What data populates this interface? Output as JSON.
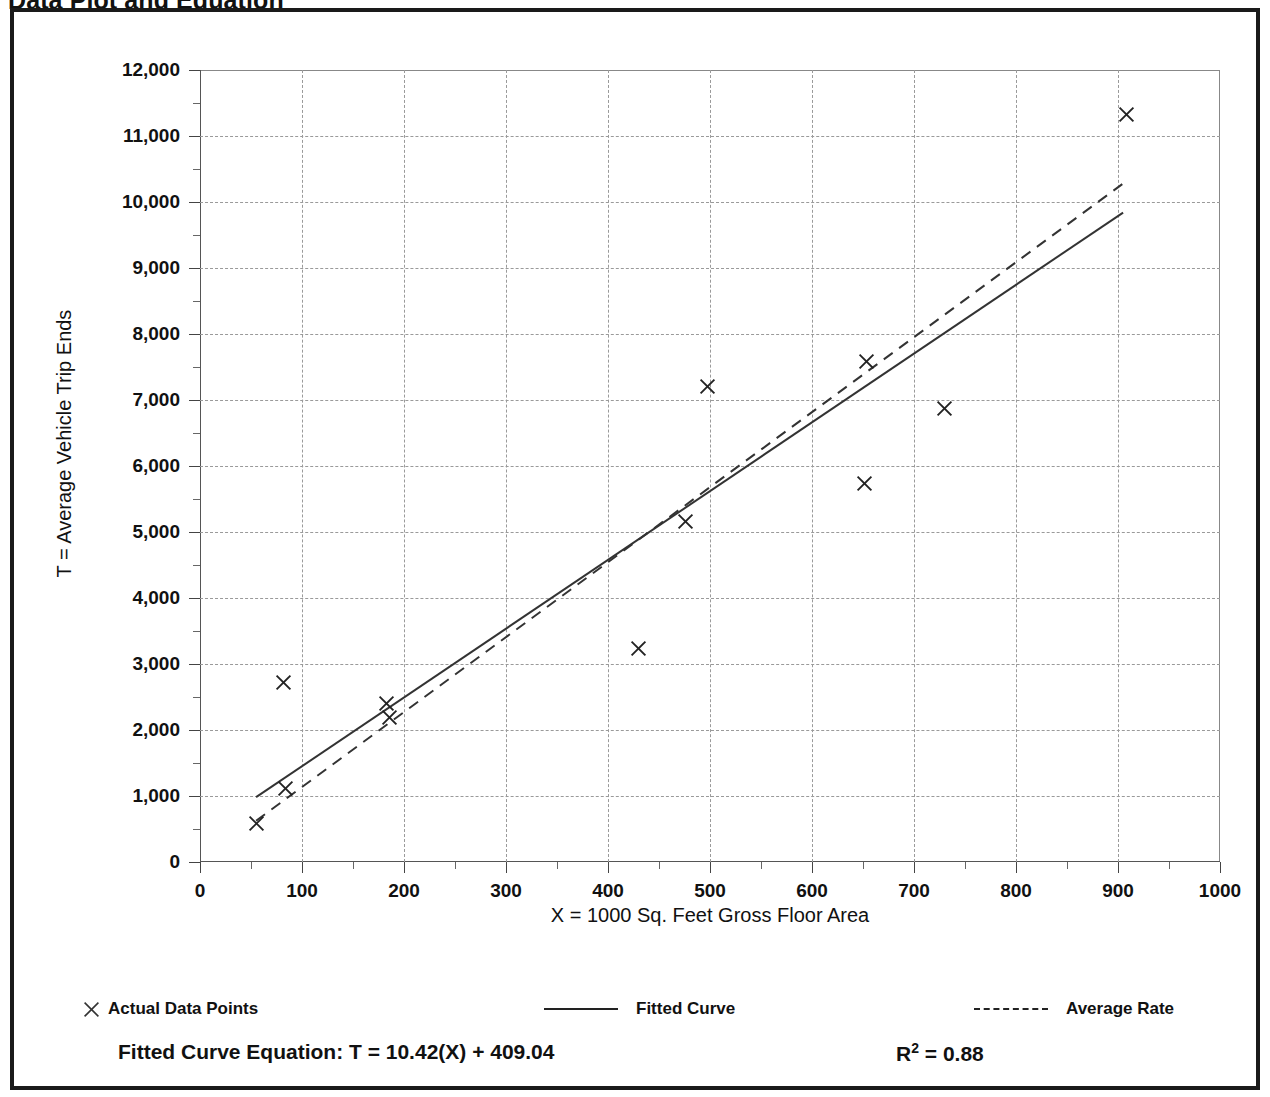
{
  "page": {
    "title": "Data Plot and Equation"
  },
  "footer": {
    "equation_label": "Fitted Curve Equation:",
    "equation": "T = 10.42(X) + 409.04",
    "equation_full": "Fitted Curve Equation:  T = 10.42(X) + 409.04",
    "r_squared_symbol": "R",
    "r_squared_exponent": "2",
    "r_squared_value": "= 0.88",
    "r_squared_full": "R2 = 0.88"
  },
  "legend": {
    "items": [
      {
        "label": "Actual Data Points",
        "marker": "x-marker",
        "style": "marker"
      },
      {
        "label": "Fitted Curve",
        "marker": "solid-line",
        "style": "solid"
      },
      {
        "label": "Average Rate",
        "marker": "dashed-line",
        "style": "dashed"
      }
    ]
  },
  "chart_data": {
    "type": "scatter",
    "title": "Data Plot and Equation",
    "xlabel": "X = 1000 Sq. Feet Gross Floor Area",
    "ylabel": "T = Average Vehicle Trip Ends",
    "xlim": [
      0,
      1000
    ],
    "ylim": [
      0,
      12000
    ],
    "xticks": [
      0,
      100,
      200,
      300,
      400,
      500,
      600,
      700,
      800,
      900,
      1000
    ],
    "xtick_labels": [
      "0",
      "100",
      "200",
      "300",
      "400",
      "500",
      "600",
      "700",
      "800",
      "900",
      "1000"
    ],
    "xtick_minor_step": 50,
    "yticks": [
      0,
      1000,
      2000,
      3000,
      4000,
      5000,
      6000,
      7000,
      8000,
      9000,
      10000,
      11000,
      12000
    ],
    "ytick_labels": [
      "0",
      "1,000",
      "2,000",
      "3,000",
      "4,000",
      "5,000",
      "6,000",
      "7,000",
      "8,000",
      "9,000",
      "10,000",
      "11,000",
      "12,000"
    ],
    "ytick_minor_step": 500,
    "grid": true,
    "grid_style": "dashed",
    "legend_position": "below-axes",
    "series": [
      {
        "name": "Actual Data Points",
        "type": "scatter",
        "marker": "x",
        "points": [
          {
            "x": 55,
            "y": 590
          },
          {
            "x": 82,
            "y": 2720
          },
          {
            "x": 84,
            "y": 1120
          },
          {
            "x": 183,
            "y": 2400
          },
          {
            "x": 186,
            "y": 2190
          },
          {
            "x": 430,
            "y": 3240
          },
          {
            "x": 476,
            "y": 5160
          },
          {
            "x": 498,
            "y": 7200
          },
          {
            "x": 651,
            "y": 5740
          },
          {
            "x": 653,
            "y": 7590
          },
          {
            "x": 730,
            "y": 6870
          },
          {
            "x": 908,
            "y": 11320
          }
        ]
      },
      {
        "name": "Fitted Curve",
        "type": "line",
        "style": "solid",
        "equation": "T = 10.42(X) + 409.04",
        "slope": 10.42,
        "intercept": 409.04,
        "r_squared": 0.88,
        "endpoints": [
          {
            "x": 55,
            "y": 982
          },
          {
            "x": 905,
            "y": 9840
          }
        ]
      },
      {
        "name": "Average Rate",
        "type": "line",
        "style": "dashed",
        "endpoints": [
          {
            "x": 55,
            "y": 625
          },
          {
            "x": 905,
            "y": 10280
          }
        ]
      }
    ]
  },
  "colors": {
    "frame": "#1a1a1a",
    "grid": "#9a9a9a",
    "axis": "#444444",
    "ink": "#111111",
    "background": "#ffffff"
  }
}
